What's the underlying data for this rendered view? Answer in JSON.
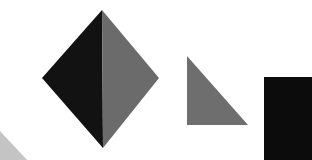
{
  "canvas": {
    "width": 312,
    "height": 160,
    "background": "#ffffff"
  },
  "shapes": {
    "diamond": {
      "left_half_color": "#121212",
      "right_half_color": "#6b6b6b",
      "top": [
        102,
        10
      ],
      "left": [
        42,
        78
      ],
      "right": [
        159,
        78
      ],
      "bottom": [
        103,
        148
      ]
    },
    "right_triangle": {
      "color": "#6e6e6e",
      "points": [
        [
          187,
          56
        ],
        [
          187,
          125
        ],
        [
          248,
          125
        ]
      ]
    },
    "black_rectangle": {
      "color": "#0c0c0c",
      "x": 264,
      "y": 77,
      "width": 48,
      "height": 83
    },
    "corner_triangle": {
      "color": "#c4c4c4",
      "points": [
        [
          0,
          131
        ],
        [
          0,
          160
        ],
        [
          27,
          160
        ]
      ]
    }
  }
}
